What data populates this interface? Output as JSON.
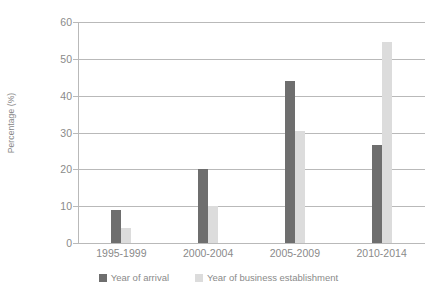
{
  "chart_data": {
    "type": "bar",
    "title": "",
    "subtitle": "",
    "xlabel": "",
    "ylabel": "Percentage (%)",
    "categories": [
      "1995-1999",
      "2000-2004",
      "2005-2009",
      "2010-2014"
    ],
    "series": [
      {
        "name": "Year of arrival",
        "color": "#6e6e6e",
        "values": [
          9,
          20,
          44,
          26.5
        ]
      },
      {
        "name": "Year of business establishment",
        "color": "#dcdcdc",
        "values": [
          4,
          10,
          30.5,
          54.5
        ]
      }
    ],
    "ylim": [
      0,
      60
    ],
    "y_ticks": [
      0,
      10,
      20,
      30,
      40,
      50,
      60
    ],
    "y_tick_labels": [
      "0",
      "10",
      "20",
      "30",
      "40",
      "50",
      "60"
    ],
    "grid": true,
    "grid_axis": "y",
    "legend_position": "bottom",
    "background_color": "#ffffff",
    "axis_color": "#b9b9b9",
    "text_color": "#8a8a8a"
  }
}
